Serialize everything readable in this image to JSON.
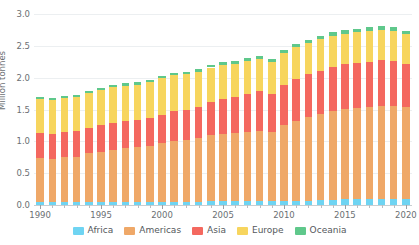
{
  "chart_data": {
    "type": "bar",
    "stacked": true,
    "title": "",
    "subtitle": "",
    "xlabel": "",
    "ylabel": "Million tonnes",
    "ylim": [
      0,
      3.0
    ],
    "yticks": [
      0.0,
      0.5,
      1.0,
      1.5,
      2.0,
      2.5,
      3.0
    ],
    "ytick_labels": [
      "0.0",
      "0.5",
      "1.0",
      "1.5",
      "2.0",
      "2.5",
      "3.0"
    ],
    "xlim_labels": [
      "1990",
      "1995",
      "2000",
      "2005",
      "2010",
      "2015",
      "2020"
    ],
    "grid": true,
    "legend_position": "bottom",
    "categories": [
      "1990",
      "1991",
      "1992",
      "1993",
      "1994",
      "1995",
      "1996",
      "1997",
      "1998",
      "1999",
      "2000",
      "2001",
      "2002",
      "2003",
      "2004",
      "2005",
      "2006",
      "2007",
      "2008",
      "2009",
      "2010",
      "2011",
      "2012",
      "2013",
      "2014",
      "2015",
      "2016",
      "2017",
      "2018",
      "2019",
      "2020"
    ],
    "series": [
      {
        "name": "Africa",
        "color": "#6fd4f2",
        "values": [
          0.05,
          0.05,
          0.05,
          0.05,
          0.05,
          0.05,
          0.05,
          0.05,
          0.05,
          0.05,
          0.05,
          0.05,
          0.05,
          0.05,
          0.06,
          0.06,
          0.06,
          0.06,
          0.06,
          0.06,
          0.07,
          0.07,
          0.07,
          0.08,
          0.08,
          0.09,
          0.09,
          0.09,
          0.1,
          0.1,
          0.1
        ]
      },
      {
        "name": "Americas",
        "color": "#efa868",
        "values": [
          0.69,
          0.68,
          0.7,
          0.71,
          0.76,
          0.79,
          0.82,
          0.85,
          0.86,
          0.88,
          0.93,
          0.96,
          0.97,
          1.0,
          1.04,
          1.06,
          1.07,
          1.09,
          1.11,
          1.09,
          1.18,
          1.25,
          1.31,
          1.35,
          1.39,
          1.42,
          1.43,
          1.45,
          1.46,
          1.46,
          1.44
        ]
      },
      {
        "name": "Asia",
        "color": "#f4685f",
        "values": [
          0.39,
          0.39,
          0.39,
          0.4,
          0.4,
          0.41,
          0.42,
          0.42,
          0.42,
          0.43,
          0.44,
          0.47,
          0.48,
          0.49,
          0.52,
          0.55,
          0.57,
          0.6,
          0.62,
          0.6,
          0.63,
          0.66,
          0.67,
          0.68,
          0.7,
          0.7,
          0.71,
          0.71,
          0.71,
          0.7,
          0.68
        ]
      },
      {
        "name": "Europe",
        "color": "#f7d55e",
        "values": [
          0.54,
          0.53,
          0.54,
          0.54,
          0.55,
          0.56,
          0.56,
          0.55,
          0.56,
          0.57,
          0.57,
          0.56,
          0.55,
          0.55,
          0.54,
          0.53,
          0.52,
          0.51,
          0.5,
          0.5,
          0.51,
          0.5,
          0.49,
          0.49,
          0.49,
          0.48,
          0.48,
          0.48,
          0.48,
          0.47,
          0.46
        ]
      },
      {
        "name": "Oceania",
        "color": "#5fc88b",
        "values": [
          0.03,
          0.03,
          0.03,
          0.03,
          0.03,
          0.03,
          0.03,
          0.04,
          0.04,
          0.04,
          0.04,
          0.04,
          0.04,
          0.04,
          0.04,
          0.05,
          0.05,
          0.05,
          0.05,
          0.05,
          0.05,
          0.05,
          0.05,
          0.05,
          0.06,
          0.06,
          0.06,
          0.06,
          0.06,
          0.06,
          0.06
        ]
      }
    ],
    "totals": [
      1.7,
      1.68,
      1.71,
      1.73,
      1.79,
      1.84,
      1.88,
      1.91,
      1.93,
      1.97,
      2.03,
      2.08,
      2.09,
      2.13,
      2.2,
      2.29,
      2.31,
      2.31,
      2.34,
      2.3,
      2.44,
      2.53,
      2.59,
      2.65,
      2.72,
      2.75,
      2.77,
      2.79,
      2.81,
      2.79,
      2.74
    ]
  },
  "legend": {
    "items": [
      {
        "label": "Africa",
        "color": "#6fd4f2"
      },
      {
        "label": "Americas",
        "color": "#efa868"
      },
      {
        "label": "Asia",
        "color": "#f4685f"
      },
      {
        "label": "Europe",
        "color": "#f7d55e"
      },
      {
        "label": "Oceania",
        "color": "#5fc88b"
      }
    ]
  },
  "axes": {
    "y_label": "Million tonnes"
  }
}
